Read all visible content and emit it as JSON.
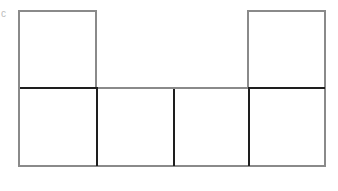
{
  "diagram": {
    "type": "cube-net",
    "colors": {
      "outline": "#8a8a8a",
      "fold_line": "#1e1e1e",
      "background": "#ffffff"
    },
    "faces": [
      {
        "id": "top-left",
        "row": 0,
        "col": 0
      },
      {
        "id": "top-right",
        "row": 0,
        "col": 3
      },
      {
        "id": "bottom-1",
        "row": 1,
        "col": 0
      },
      {
        "id": "bottom-2",
        "row": 1,
        "col": 1
      },
      {
        "id": "bottom-3",
        "row": 1,
        "col": 2
      },
      {
        "id": "bottom-4",
        "row": 1,
        "col": 3
      }
    ],
    "corner_mark": "c"
  }
}
